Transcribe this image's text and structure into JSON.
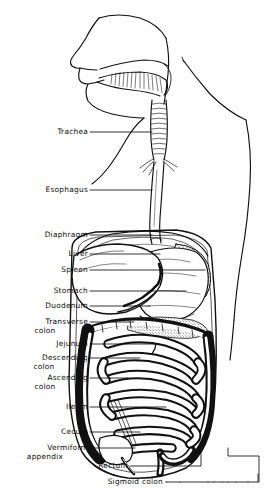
{
  "figure": {
    "width": 267,
    "height": 494,
    "background_color": "#fefefe",
    "ink_color": "#0b0b0b",
    "style": "black-and-white line engraving with stipple and solid fills"
  },
  "labels": [
    {
      "id": "trachea",
      "text": "Trachea",
      "text2": "",
      "x": 88,
      "y": 132,
      "leader_to_x": 152,
      "leader_to_y": 132
    },
    {
      "id": "esophagus",
      "text": "Esophagus",
      "text2": "",
      "x": 88,
      "y": 190,
      "leader_to_x": 152,
      "leader_to_y": 190
    },
    {
      "id": "diaphragm",
      "text": "Diaphragm",
      "text2": "",
      "x": 88,
      "y": 235,
      "leader_to_x": 152,
      "leader_to_y": 235
    },
    {
      "id": "liver",
      "text": "Liver",
      "text2": "",
      "x": 88,
      "y": 254,
      "leader_to_x": 160,
      "leader_to_y": 254
    },
    {
      "id": "spleen",
      "text": "Spleen",
      "text2": "",
      "x": 88,
      "y": 270,
      "leader_to_x": 205,
      "leader_to_y": 270
    },
    {
      "id": "stomach",
      "text": "Stomach",
      "text2": "",
      "x": 88,
      "y": 291,
      "leader_to_x": 186,
      "leader_to_y": 291
    },
    {
      "id": "duodenum",
      "text": "Duodenum",
      "text2": "",
      "x": 88,
      "y": 306,
      "leader_to_x": 150,
      "leader_to_y": 306
    },
    {
      "id": "transverse-colon",
      "text": "Transverse",
      "text2": "colon",
      "x": 88,
      "y": 322,
      "leader_to_x": 134,
      "leader_to_y": 322
    },
    {
      "id": "jejunum",
      "text": "Jejunum",
      "text2": "",
      "x": 88,
      "y": 344,
      "leader_to_x": 160,
      "leader_to_y": 344
    },
    {
      "id": "descending-colon",
      "text": "Descending",
      "text2": "colon",
      "x": 88,
      "y": 358,
      "leader_to_x": 140,
      "leader_to_y": 358
    },
    {
      "id": "ascending-colon",
      "text": "Ascending",
      "text2": "colon",
      "x": 88,
      "y": 378,
      "leader_to_x": 128,
      "leader_to_y": 378
    },
    {
      "id": "ileum",
      "text": "Ileum",
      "text2": "",
      "x": 88,
      "y": 407,
      "leader_to_x": 166,
      "leader_to_y": 407
    },
    {
      "id": "cecum",
      "text": "Cecum",
      "text2": "",
      "x": 88,
      "y": 432,
      "leader_to_x": 140,
      "leader_to_y": 432
    },
    {
      "id": "vermiform-appendix",
      "text": "Vermiform",
      "text2": "appendix",
      "x": 88,
      "y": 448,
      "leader_to_x": 135,
      "leader_to_y": 448
    },
    {
      "id": "rectum",
      "text": "Rectum",
      "text2": "",
      "x": 128,
      "y": 466,
      "leader_to_x": 201,
      "leader_to_y": 466
    },
    {
      "id": "sigmoid-colon",
      "text": "Sigmoid colon",
      "text2": "",
      "x": 163,
      "y": 482,
      "leader_to_x": 258,
      "leader_to_y": 482
    }
  ],
  "structures": [
    {
      "id": "head-profile",
      "name": "Head in left-facing profile"
    },
    {
      "id": "oral-cavity",
      "name": "Mouth and tongue"
    },
    {
      "id": "neck-outline",
      "name": "Neck and shoulder contour"
    },
    {
      "id": "trachea-tube",
      "name": "Trachea with cartilage rings"
    },
    {
      "id": "esophagus-tube",
      "name": "Esophagus"
    },
    {
      "id": "diaphragm-arch",
      "name": "Diaphragm dome"
    },
    {
      "id": "liver-mass",
      "name": "Liver"
    },
    {
      "id": "spleen-mass",
      "name": "Spleen"
    },
    {
      "id": "stomach-mass",
      "name": "Stomach"
    },
    {
      "id": "duodenum-loop",
      "name": "Duodenum"
    },
    {
      "id": "transverse-colon-seg",
      "name": "Transverse colon"
    },
    {
      "id": "descending-colon-seg",
      "name": "Descending colon"
    },
    {
      "id": "ascending-colon-seg",
      "name": "Ascending colon"
    },
    {
      "id": "small-intestine",
      "name": "Jejunum and ileum coils"
    },
    {
      "id": "cecum-mass",
      "name": "Cecum"
    },
    {
      "id": "appendix",
      "name": "Vermiform appendix"
    },
    {
      "id": "rectum-seg",
      "name": "Rectum"
    },
    {
      "id": "sigmoid-seg",
      "name": "Sigmoid colon"
    },
    {
      "id": "abdominal-wall",
      "name": "Abdominal cavity outline"
    },
    {
      "id": "torso-outline",
      "name": "Right torso and arm contour"
    }
  ]
}
